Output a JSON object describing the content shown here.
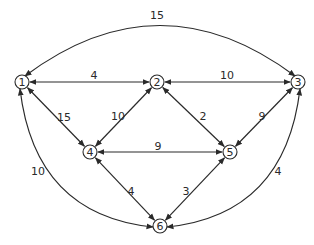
{
  "diagram": {
    "type": "weighted-graph",
    "directed": "bidirectional",
    "colors": {
      "stroke": "#2a2a2a",
      "background": "#ffffff"
    },
    "nodes": [
      {
        "id": "1",
        "label": "1",
        "x": 22,
        "y": 82
      },
      {
        "id": "2",
        "label": "2",
        "x": 157,
        "y": 82
      },
      {
        "id": "3",
        "label": "3",
        "x": 298,
        "y": 82
      },
      {
        "id": "4",
        "label": "4",
        "x": 90,
        "y": 152
      },
      {
        "id": "5",
        "label": "5",
        "x": 230,
        "y": 152
      },
      {
        "id": "6",
        "label": "6",
        "x": 160,
        "y": 226
      }
    ],
    "edges": [
      {
        "from": "1",
        "to": "3",
        "weight": "15",
        "shape": "arc-top"
      },
      {
        "from": "1",
        "to": "2",
        "weight": "4",
        "shape": "straight"
      },
      {
        "from": "2",
        "to": "3",
        "weight": "10",
        "shape": "straight"
      },
      {
        "from": "1",
        "to": "4",
        "weight": "15",
        "shape": "straight"
      },
      {
        "from": "2",
        "to": "4",
        "weight": "10",
        "shape": "straight"
      },
      {
        "from": "2",
        "to": "5",
        "weight": "2",
        "shape": "straight"
      },
      {
        "from": "3",
        "to": "5",
        "weight": "9",
        "shape": "straight"
      },
      {
        "from": "4",
        "to": "5",
        "weight": "9",
        "shape": "straight"
      },
      {
        "from": "4",
        "to": "6",
        "weight": "4",
        "shape": "straight"
      },
      {
        "from": "5",
        "to": "6",
        "weight": "3",
        "shape": "straight"
      },
      {
        "from": "1",
        "to": "6",
        "weight": "10",
        "shape": "arc-left"
      },
      {
        "from": "3",
        "to": "6",
        "weight": "4",
        "shape": "arc-right"
      }
    ]
  }
}
